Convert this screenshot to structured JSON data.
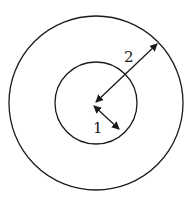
{
  "diagram": {
    "type": "concentric-circles",
    "center": [
      96,
      103
    ],
    "outer_circle": {
      "radius": 87
    },
    "inner_circle": {
      "radius": 41
    },
    "arrows": [
      {
        "label": "2",
        "from": [
          96,
          103
        ],
        "to": [
          157,
          45
        ],
        "label_pos": [
          128,
          62
        ]
      },
      {
        "label": "1",
        "from": [
          96,
          107
        ],
        "to": [
          118,
          128
        ],
        "label_pos": [
          97,
          132
        ]
      }
    ],
    "stroke_color": "#1a1a1a"
  }
}
